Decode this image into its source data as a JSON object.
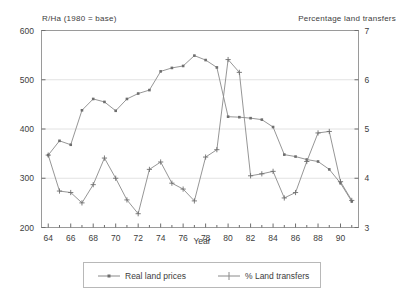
{
  "chart_data": {
    "type": "line",
    "title": "",
    "xlabel": "Year",
    "left_axis_title": "R/Ha (1980 = base)",
    "right_axis_title": "Percentage land transfers",
    "grid": true,
    "legend_position": "bottom",
    "x": [
      64,
      65,
      66,
      67,
      68,
      69,
      70,
      71,
      72,
      73,
      74,
      75,
      76,
      77,
      78,
      79,
      80,
      81,
      82,
      83,
      84,
      85,
      86,
      87,
      88,
      89,
      90,
      91
    ],
    "xtick_labels": [
      "64",
      "66",
      "68",
      "70",
      "72",
      "74",
      "76",
      "78",
      "80",
      "82",
      "84",
      "86",
      "88",
      "90"
    ],
    "xtick_values": [
      64,
      66,
      68,
      70,
      72,
      74,
      76,
      78,
      80,
      82,
      84,
      86,
      88,
      90
    ],
    "xlim": [
      63.4,
      91.6
    ],
    "left_axis": {
      "label": "R/Ha (1980 = base)",
      "ylim": [
        200,
        600
      ],
      "ticks": [
        200,
        300,
        400,
        500,
        600
      ],
      "tick_labels": [
        "200",
        "300",
        "400",
        "500",
        "600"
      ]
    },
    "right_axis": {
      "label": "Percentage land transfers",
      "ylim": [
        3,
        7
      ],
      "ticks": [
        3,
        4,
        5,
        6,
        7
      ],
      "tick_labels": [
        "3",
        "4",
        "5",
        "6",
        "7"
      ]
    },
    "series": [
      {
        "name": "Real land prices",
        "axis": "left",
        "marker": "square-dot",
        "color": "#8a8a8a",
        "values": [
          347,
          376,
          368,
          438,
          461,
          455,
          437,
          461,
          472,
          479,
          517,
          524,
          528,
          549,
          540,
          525,
          425,
          424,
          422,
          419,
          404,
          348,
          344,
          338,
          334,
          318,
          290,
          253
        ]
      },
      {
        "name": "% Land transfers",
        "axis": "right",
        "marker": "plus",
        "color": "#8a8a8a",
        "values": [
          4.47,
          3.74,
          3.71,
          3.5,
          3.87,
          4.41,
          4.0,
          3.56,
          3.28,
          4.18,
          4.33,
          3.9,
          3.78,
          3.54,
          4.43,
          4.58,
          6.41,
          6.15,
          4.05,
          4.09,
          4.14,
          3.6,
          3.71,
          4.34,
          4.92,
          4.95,
          3.93,
          3.55
        ]
      }
    ]
  },
  "legend": {
    "entries": [
      {
        "label": "Real land prices"
      },
      {
        "label": "% Land transfers"
      }
    ]
  }
}
